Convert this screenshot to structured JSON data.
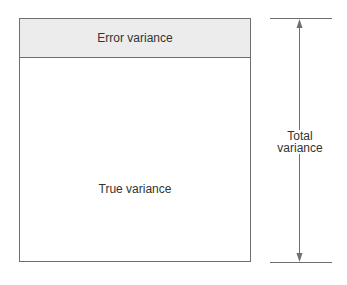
{
  "diagram": {
    "error_label": "Error variance",
    "true_label": "True variance",
    "total_label_line1": "Total",
    "total_label_line2": "variance"
  },
  "colors": {
    "line": "#6e6e6e",
    "error_fill": "#ececec"
  }
}
